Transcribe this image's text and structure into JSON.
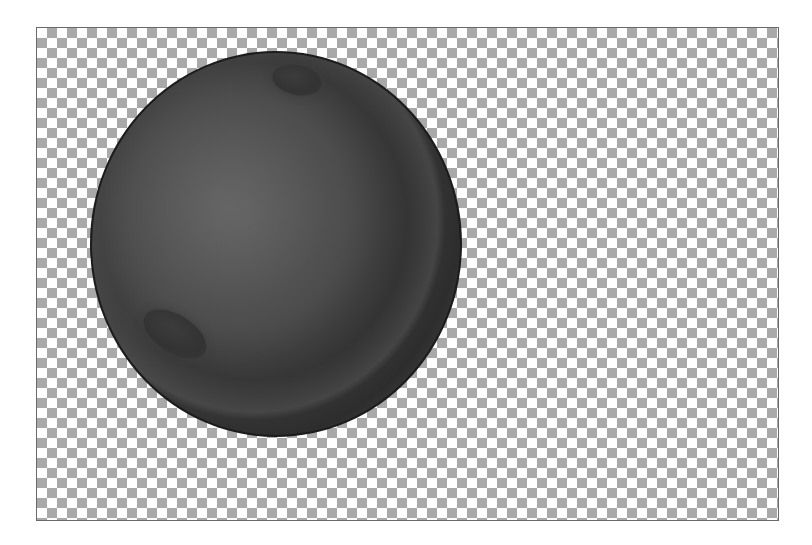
{
  "canvas": {
    "background": "transparency-checkerboard",
    "checker_colors": [
      "#ffffff",
      "#a9a9a9"
    ],
    "checker_size_px": 10,
    "border_color": "#6a6a6a"
  },
  "layers": [
    {
      "name": "sphere",
      "shape": "ellipse",
      "fill": "#4a4a4a",
      "shadow_color": "#222222",
      "stroke": "#1c1c1c",
      "highlights": [
        {
          "name": "highlight-top",
          "fill": "#333333"
        },
        {
          "name": "highlight-bottom",
          "fill": "#333333"
        }
      ]
    }
  ]
}
